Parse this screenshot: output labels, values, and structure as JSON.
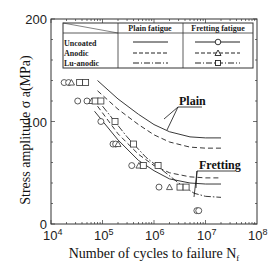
{
  "chart_data": {
    "type": "scatter",
    "title": "",
    "xlabel": "Number of cycles to failure Nᶠ",
    "xlabel_main": "Number of cycles to failure N",
    "xlabel_sub": "f",
    "ylabel": "Stress amplitude σ a(MPa)",
    "xscale": "log",
    "xlim": [
      10000,
      100000000
    ],
    "ylim": [
      0,
      200
    ],
    "x_ticks": [
      {
        "value": 10000,
        "base": "10",
        "exp": "4"
      },
      {
        "value": 100000,
        "base": "10",
        "exp": "5"
      },
      {
        "value": 1000000,
        "base": "10",
        "exp": "6"
      },
      {
        "value": 10000000,
        "base": "10",
        "exp": "7"
      },
      {
        "value": 100000000,
        "base": "10",
        "exp": "8"
      }
    ],
    "y_ticks": [
      {
        "value": 0,
        "label": "0"
      },
      {
        "value": 100,
        "label": "100"
      },
      {
        "value": 200,
        "label": "200"
      }
    ],
    "grid": false,
    "legend": {
      "position": "upper-left inside",
      "columns": [
        "",
        "Plain fatigue",
        "Fretting fatigue"
      ],
      "rows": [
        {
          "label": "Uncoated",
          "plain_style": "solid",
          "fretting_style": "solid",
          "marker": "circle"
        },
        {
          "label": "Anodic",
          "plain_style": "dashed",
          "fretting_style": "dashed",
          "marker": "triangle"
        },
        {
          "label": "Lu-anodic",
          "plain_style": "dash-dot",
          "fretting_style": "dash-dot",
          "marker": "square"
        }
      ]
    },
    "annotations": [
      {
        "text": "Plain",
        "target": "plain fatigue curves"
      },
      {
        "text": "Fretting",
        "target": "fretting fatigue curves"
      }
    ],
    "series": [
      {
        "name": "Uncoated - Fretting fatigue",
        "marker": "circle",
        "points": [
          [
            18000,
            138
          ],
          [
            22000,
            138
          ],
          [
            33000,
            120
          ],
          [
            50000,
            120
          ],
          [
            93000,
            100
          ],
          [
            160000,
            78
          ],
          [
            180000,
            78
          ],
          [
            370000,
            57
          ],
          [
            1250000,
            36
          ],
          [
            6800000,
            13
          ],
          [
            7400000,
            13
          ]
        ]
      },
      {
        "name": "Anodic - Fretting fatigue",
        "marker": "triangle",
        "points": [
          [
            25000,
            138
          ],
          [
            62000,
            120
          ],
          [
            200000,
            78
          ],
          [
            510000,
            57
          ],
          [
            2000000,
            36
          ]
        ]
      },
      {
        "name": "Lu-anodic - Fretting fatigue",
        "marker": "square",
        "points": [
          [
            36000,
            138
          ],
          [
            47000,
            138
          ],
          [
            72000,
            120
          ],
          [
            93000,
            120
          ],
          [
            175000,
            100
          ],
          [
            400000,
            78
          ],
          [
            620000,
            57
          ],
          [
            1200000,
            57
          ],
          [
            3200000,
            36
          ],
          [
            4200000,
            36
          ]
        ]
      },
      {
        "name": "Uncoated - Plain fatigue",
        "style": "solid",
        "x": [
          80000,
          200000,
          500000,
          1000000,
          2000000,
          5000000,
          10000000,
          20000000
        ],
        "y": [
          140,
          122,
          107,
          97,
          90,
          85,
          84,
          84
        ]
      },
      {
        "name": "Anodic - Plain fatigue",
        "style": "dashed",
        "x": [
          80000,
          200000,
          500000,
          1000000,
          2000000,
          5000000,
          10000000,
          20000000
        ],
        "y": [
          130,
          112,
          97,
          87,
          80,
          75,
          74,
          74
        ]
      },
      {
        "name": "Uncoated - Fretting fatigue curve",
        "style": "solid",
        "x": [
          70000,
          200000,
          500000,
          1000000,
          2000000,
          5000000,
          10000000,
          20000000
        ],
        "y": [
          110,
          82,
          62,
          52,
          44,
          40,
          39,
          39
        ]
      },
      {
        "name": "Anodic - Fretting fatigue curve",
        "style": "dashed",
        "x": [
          80000,
          200000,
          500000,
          1000000,
          2000000,
          5000000,
          10000000,
          20000000
        ],
        "y": [
          115,
          88,
          68,
          57,
          50,
          46,
          45,
          45
        ]
      },
      {
        "name": "Lu-anodic - Fretting fatigue curve",
        "style": "dash-dot",
        "x": [
          100000,
          300000,
          700000,
          1500000,
          3000000,
          6000000,
          10000000,
          20000000
        ],
        "y": [
          115,
          85,
          65,
          52,
          40,
          30,
          27,
          26
        ]
      }
    ]
  }
}
